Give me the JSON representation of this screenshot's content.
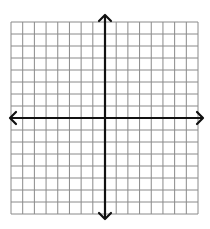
{
  "diagram": {
    "type": "coordinate-plane",
    "grid": {
      "columns": 16,
      "rows": 16,
      "left": 11,
      "top": 22,
      "right": 198,
      "bottom": 214,
      "line_color": "#8a8a8a"
    },
    "axes": {
      "origin_x": 105,
      "origin_y": 118,
      "color": "#111111",
      "x_axis": {
        "from": 10,
        "to": 203,
        "arrows": "both"
      },
      "y_axis": {
        "from": 15,
        "to": 219,
        "arrows": "both"
      }
    },
    "background": "#ffffff"
  }
}
